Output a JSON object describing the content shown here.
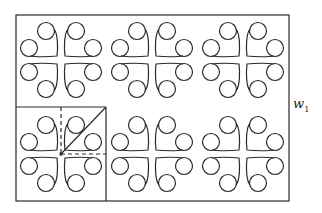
{
  "figure": {
    "frame": {
      "x": 16,
      "y": 15,
      "width": 273,
      "height": 186
    },
    "motif_centers": [
      {
        "x": 61,
        "y": 60
      },
      {
        "x": 152,
        "y": 60
      },
      {
        "x": 243,
        "y": 60
      },
      {
        "x": 61,
        "y": 154
      },
      {
        "x": 152,
        "y": 154
      },
      {
        "x": 243,
        "y": 154
      }
    ],
    "highlight_cell": {
      "x": 16,
      "y": 107,
      "width": 90,
      "height": 94
    },
    "stroke_color": "#2a2a2a",
    "label": {
      "base": "w",
      "subscript": "1"
    }
  }
}
